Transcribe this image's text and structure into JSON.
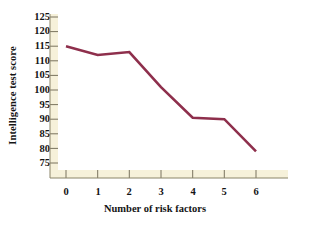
{
  "chart_data": {
    "type": "line",
    "title": "",
    "xlabel": "Number of risk factors",
    "ylabel": "Intelligence test score",
    "x": [
      0,
      1,
      2,
      3,
      4,
      5,
      6
    ],
    "categories": [
      "0",
      "1",
      "2",
      "3",
      "4",
      "5",
      "6"
    ],
    "values": [
      115,
      112,
      113,
      101,
      90.5,
      90,
      79
    ],
    "series": [
      {
        "name": "Intelligence test score",
        "values": [
          115,
          112,
          113,
          101,
          90.5,
          90,
          79
        ]
      }
    ],
    "xlim": [
      0,
      6
    ],
    "ylim": [
      75,
      125
    ],
    "yticks": [
      75,
      80,
      85,
      90,
      95,
      100,
      105,
      110,
      115,
      120,
      125
    ],
    "ytick_labels": [
      "75",
      "80",
      "85",
      "90",
      "95",
      "100",
      "105",
      "110",
      "115",
      "120",
      "125"
    ],
    "xticks": [
      0,
      1,
      2,
      3,
      4,
      5,
      6
    ],
    "xtick_labels": [
      "0",
      "1",
      "2",
      "3",
      "4",
      "5",
      "6"
    ],
    "grid": false,
    "legend": null,
    "line_color": "#8e2f4c",
    "axis_band_color": "#f6f1da",
    "background_color": "#ffffff"
  }
}
